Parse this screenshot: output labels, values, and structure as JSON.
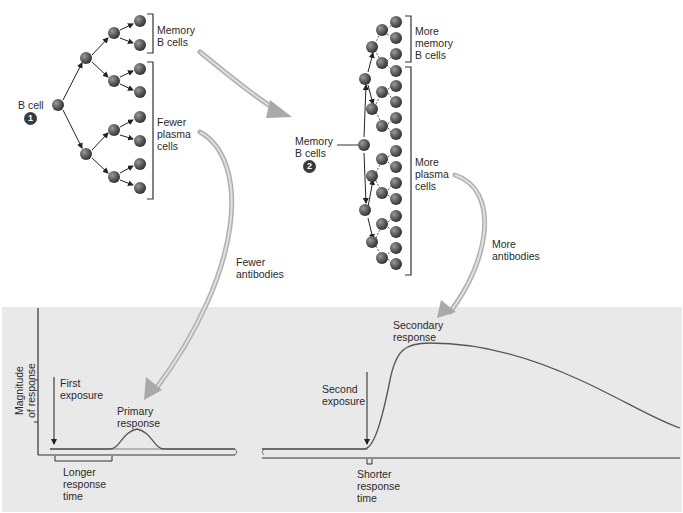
{
  "diagram": {
    "topic": "Primary vs. secondary immune response",
    "primary_tree": {
      "start_label": "B cell",
      "step_number": "1",
      "memory_label": "Memory\nB cells",
      "plasma_label": "Fewer\nplasma\ncells",
      "antibody_label": "Fewer\nantibodies"
    },
    "secondary_tree": {
      "start_label": "Memory\nB cells",
      "step_number": "2",
      "memory_label": "More\nmemory\nB cells",
      "plasma_label": "More\nplasma\ncells",
      "antibody_label": "More\nantibodies"
    },
    "graph": {
      "y_axis_label": "Magnitude\nof response",
      "first_exposure_label": "First\nexposure",
      "primary_response_label": "Primary\nresponse",
      "longer_time_label": "Longer\nresponse\ntime",
      "second_exposure_label": "Second\nexposure",
      "secondary_response_label": "Secondary\nresponse",
      "shorter_time_label": "Shorter\nresponse\ntime"
    },
    "colors": {
      "panel_bg": "#e9e9e9",
      "cell": "#5a5a5a",
      "arrow_big": "#b8b8b8",
      "axis": "#333333",
      "curve": "#555555"
    }
  }
}
